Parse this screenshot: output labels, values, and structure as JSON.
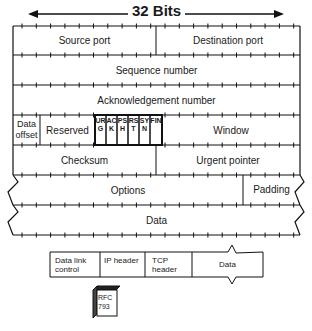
{
  "header": {
    "width_label": "32 Bits"
  },
  "rows": {
    "source_port": "Source port",
    "destination_port": "Destination port",
    "sequence_number": "Sequence number",
    "acknowledgement_number": "Acknowledgement number",
    "data_offset": "Data offset",
    "reserved": "Reserved",
    "window": "Window",
    "checksum": "Checksum",
    "urgent_pointer": "Urgent pointer",
    "options": "Options",
    "padding": "Padding",
    "data": "Data"
  },
  "flags": [
    {
      "letters": "URG"
    },
    {
      "letters": "ACK"
    },
    {
      "letters": "PSH"
    },
    {
      "letters": "RST"
    },
    {
      "letters": "SYN"
    },
    {
      "letters": "FIN"
    }
  ],
  "frame": {
    "segments": [
      "Data link control",
      "IP header",
      "TCP header",
      "Data"
    ]
  },
  "rfc": {
    "label": "RFC 793"
  }
}
